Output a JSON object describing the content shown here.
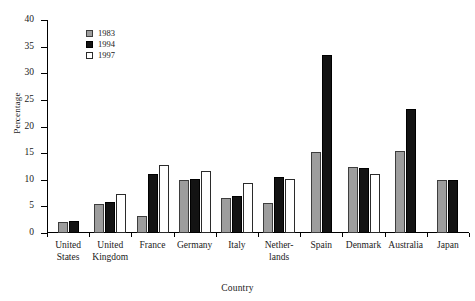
{
  "chart_data": {
    "type": "bar",
    "title": "",
    "xlabel": "Country",
    "ylabel": "Percentage",
    "ylim": [
      0,
      40
    ],
    "ytick_labels": [
      "0",
      "5",
      "10",
      "15",
      "20",
      "25",
      "30",
      "35",
      "40"
    ],
    "ytick_values": [
      0,
      5,
      10,
      15,
      20,
      25,
      30,
      35,
      40
    ],
    "grid": false,
    "legend_position": "top-left",
    "categories": [
      "United States",
      "United Kingdom",
      "France",
      "Germany",
      "Italy",
      "Netherlands",
      "Spain",
      "Denmark",
      "Australia",
      "Japan"
    ],
    "category_label_lines": [
      [
        "United",
        "States"
      ],
      [
        "United",
        "Kingdom"
      ],
      [
        "France"
      ],
      [
        "Germany"
      ],
      [
        "Italy"
      ],
      [
        "Nether-",
        "lands"
      ],
      [
        "Spain"
      ],
      [
        "Denmark"
      ],
      [
        "Australia"
      ],
      [
        "Japan"
      ]
    ],
    "series": [
      {
        "name": "1983",
        "values": [
          2.0,
          5.5,
          3.2,
          10.0,
          6.5,
          5.7,
          15.3,
          12.4,
          15.4,
          10.0
        ]
      },
      {
        "name": "1994",
        "values": [
          2.3,
          5.8,
          11.0,
          10.2,
          7.0,
          10.6,
          33.5,
          12.2,
          23.2,
          10.0
        ]
      },
      {
        "name": "1997",
        "values": [
          null,
          7.3,
          12.8,
          11.7,
          9.3,
          10.1,
          null,
          11.0,
          null,
          null
        ]
      }
    ]
  },
  "legend": {
    "entries": [
      {
        "label": "1983",
        "swatch": "y1983"
      },
      {
        "label": "1994",
        "swatch": "y1994"
      },
      {
        "label": "1997",
        "swatch": "y1997"
      }
    ]
  },
  "colors": {
    "series_1983": "#9d9d9d",
    "series_1994": "#131313",
    "series_1997": "#ffffff",
    "axis": "#000000",
    "background": "#ffffff"
  }
}
